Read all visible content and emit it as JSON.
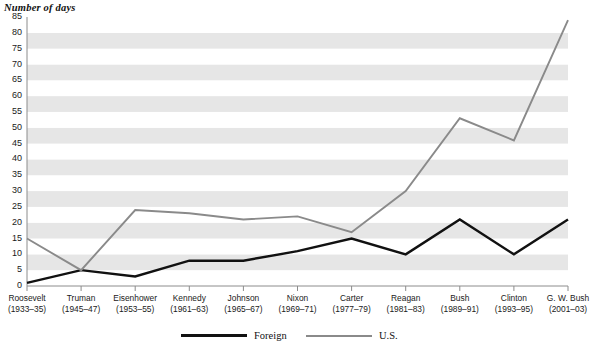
{
  "chart_data": {
    "type": "line",
    "title": "Number of days",
    "xlabel": "",
    "ylabel": "Number of days",
    "ylim": [
      0,
      85
    ],
    "ytick_step": 5,
    "yticks": [
      0,
      5,
      10,
      15,
      20,
      25,
      30,
      35,
      40,
      45,
      50,
      55,
      60,
      65,
      70,
      75,
      80,
      85
    ],
    "grid": "horizontal-bands",
    "legend_position": "bottom",
    "categories": [
      "Roosevelt",
      "Truman",
      "Eisenhower",
      "Kennedy",
      "Johnson",
      "Nixon",
      "Carter",
      "Reagan",
      "Bush",
      "Clinton",
      "G. W. Bush"
    ],
    "category_years": [
      "(1933–35)",
      "(1945–47)",
      "(1953–55)",
      "(1961–63)",
      "(1965–67)",
      "(1969–71)",
      "(1977–79)",
      "(1981–83)",
      "(1989–91)",
      "(1993–95)",
      "(2001–03)"
    ],
    "series": [
      {
        "name": "Foreign",
        "color": "#111111",
        "values": [
          1,
          5,
          3,
          8,
          8,
          11,
          15,
          10,
          21,
          10,
          21
        ]
      },
      {
        "name": "U.S.",
        "color": "#8a8a8a",
        "values": [
          15,
          5,
          24,
          23,
          21,
          22,
          17,
          30,
          53,
          46,
          84
        ]
      }
    ]
  },
  "legend": {
    "items": [
      {
        "label": "Foreign",
        "color": "#111111"
      },
      {
        "label": "U.S.",
        "color": "#8a8a8a"
      }
    ]
  },
  "colors": {
    "band_light": "#ffffff",
    "band_dark": "#e6e6e6",
    "axis": "#8c8c8c",
    "foreign": "#111111",
    "us": "#8a8a8a"
  }
}
